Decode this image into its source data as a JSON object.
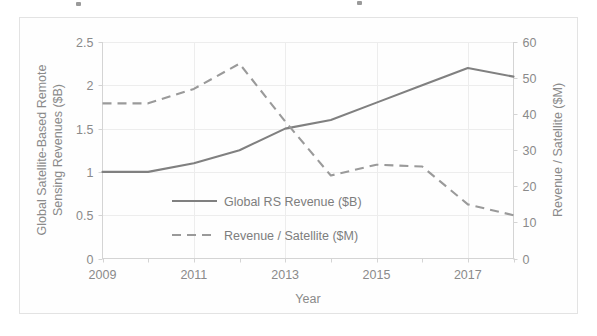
{
  "chart_data": {
    "type": "line",
    "title": "",
    "xlabel": "Year",
    "x": [
      2009,
      2010,
      2011,
      2012,
      2013,
      2014,
      2015,
      2016,
      2017,
      2018
    ],
    "xtick_labels": [
      "2009",
      "2011",
      "2013",
      "2015",
      "2017"
    ],
    "xtick_values": [
      2009,
      2011,
      2013,
      2015,
      2017
    ],
    "xlim": [
      2009,
      2018
    ],
    "grid": true,
    "legend_position": "center",
    "axes": [
      {
        "id": "left",
        "label": "Global Satellite-Based Remote Sensing Revenues ($B)",
        "label_lines": [
          "Global Satellite-Based Remote",
          "Sensing Revenues ($B)"
        ],
        "ylim": [
          0,
          2.5
        ],
        "ytick_labels": [
          "0",
          "0.5",
          "1",
          "1.5",
          "2",
          "2.5"
        ],
        "ytick_values": [
          0,
          0.5,
          1,
          1.5,
          2,
          2.5
        ]
      },
      {
        "id": "right",
        "label": "Revenue / Satellite ($M)",
        "ylim": [
          0,
          60
        ],
        "ytick_labels": [
          "0",
          "10",
          "20",
          "30",
          "40",
          "50",
          "60"
        ],
        "ytick_values": [
          0,
          10,
          20,
          30,
          40,
          50,
          60
        ]
      }
    ],
    "series": [
      {
        "name": "Global RS Revenue ($B)",
        "axis": "left",
        "style": "solid",
        "color": "#808080",
        "values": [
          1.0,
          1.0,
          1.1,
          1.25,
          1.5,
          1.6,
          1.8,
          2.0,
          2.2,
          2.1
        ]
      },
      {
        "name": "Revenue / Satellite ($M)",
        "axis": "right",
        "style": "dashed",
        "color": "#9a9a9a",
        "values": [
          43,
          43,
          47,
          54,
          38,
          23,
          26,
          25.5,
          15,
          12
        ]
      }
    ]
  },
  "legend": {
    "entries": [
      {
        "label": "Global RS Revenue ($B)",
        "style": "solid"
      },
      {
        "label": "Revenue / Satellite ($M)",
        "style": "dashed"
      }
    ]
  }
}
